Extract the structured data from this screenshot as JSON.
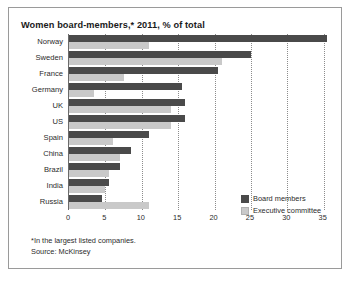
{
  "card": {
    "title": "Women board-members,* 2011, % of total"
  },
  "footnotes": {
    "note": "*In the largest listed companies.",
    "source": "Source: McKinsey"
  },
  "legend": {
    "items": [
      {
        "label": "Board members",
        "color": "#4a4a4a",
        "key": "board"
      },
      {
        "label": "Executive committee",
        "color": "#c9c9c9",
        "key": "exec"
      }
    ]
  },
  "chart_data": {
    "type": "bar",
    "orientation": "horizontal",
    "title": "Women board-members,* 2011, % of total",
    "xlabel": "",
    "ylabel": "",
    "xlim": [
      0,
      36
    ],
    "xticks": [
      0,
      5,
      10,
      15,
      20,
      25,
      30,
      35
    ],
    "grid": true,
    "grid_axis": "x",
    "legend_position": "bottom-right",
    "categories": [
      "Norway",
      "Sweden",
      "France",
      "Germany",
      "UK",
      "US",
      "Spain",
      "China",
      "Brazil",
      "India",
      "Russia"
    ],
    "series": [
      {
        "name": "Board members",
        "color": "#4a4a4a",
        "values": [
          35.5,
          25.0,
          20.5,
          15.5,
          16.0,
          16.0,
          11.0,
          8.5,
          7.0,
          5.5,
          4.5
        ]
      },
      {
        "name": "Executive committee",
        "color": "#c9c9c9",
        "values": [
          11.0,
          21.0,
          7.5,
          3.5,
          14.0,
          14.0,
          6.0,
          7.0,
          5.5,
          5.0,
          11.0
        ]
      }
    ],
    "annotations": [
      "*In the largest listed companies.",
      "Source: McKinsey"
    ]
  }
}
